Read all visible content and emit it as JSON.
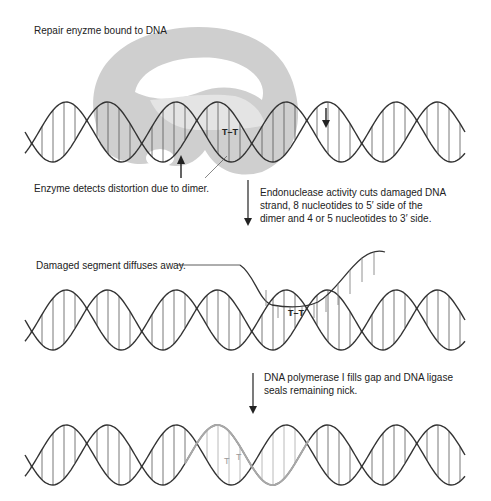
{
  "labels": {
    "enzyme_bound": "Repair enyzme bound to DNA",
    "detects": "Enzyme detects distortion due to dimer.",
    "endonuclease": "Endonuclease activity cuts damaged DNA strand, 8 nucleotides to 5′ side of the dimer and 4 or 5 nucleotides to 3′ side.",
    "segment_away": "Damaged segment diffuses away.",
    "polymerase": "DNA polymerase I fills gap and DNA ligase seals remaining nick.",
    "dimer_top": "T–T",
    "dimer_mid": "T–T",
    "dimer_bottom_a": "T",
    "dimer_bottom_b": "T"
  },
  "colors": {
    "strand": "#333333",
    "rung": "#555555",
    "enzyme": "#c9c9c9",
    "new_strand": "#a8a8a8",
    "arrow": "#222222"
  },
  "helices": [
    {
      "name": "helix-top",
      "x0": 25,
      "x1": 290,
      "cy": 132,
      "amp": 30,
      "period": 110,
      "phase": 0
    },
    {
      "name": "helix-top-right",
      "x0": 290,
      "x1": 465,
      "cy": 132,
      "amp": 30,
      "period": 110,
      "phase": 0
    },
    {
      "name": "helix-middle",
      "x0": 25,
      "x1": 465,
      "cy": 320,
      "amp": 30,
      "period": 110,
      "phase": 0
    },
    {
      "name": "helix-bottom",
      "x0": 25,
      "x1": 465,
      "cy": 455,
      "amp": 30,
      "period": 110,
      "phase": 0
    }
  ]
}
